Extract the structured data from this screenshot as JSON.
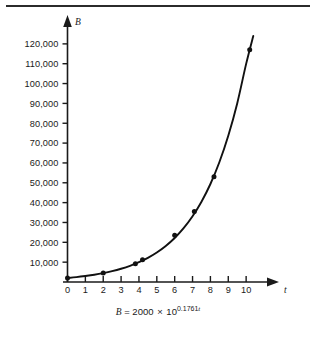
{
  "figure": {
    "background_color": "#ffffff",
    "ink_color": "#1a1a1a",
    "rule_color": "#2b2b2b"
  },
  "caption": {
    "lhs": "B",
    "equals": "=",
    "coefficient": "2000",
    "times": "×",
    "base": "10",
    "exponent_value": "0.1761",
    "exponent_var": "t"
  },
  "chart_data": {
    "type": "line",
    "title": "",
    "subtitle": "",
    "xlabel": "t",
    "ylabel": "B",
    "equation": "B = 2000 × 10^(0.1761t)",
    "grid": false,
    "legend": "none",
    "xlim": [
      0,
      11
    ],
    "ylim": [
      0,
      128000
    ],
    "x_ticks": [
      0,
      1,
      2,
      3,
      4,
      5,
      6,
      7,
      8,
      9,
      10
    ],
    "x_tick_labels": [
      "0",
      "1",
      "2",
      "3",
      "4",
      "5",
      "6",
      "7",
      "8",
      "9",
      "10"
    ],
    "y_ticks": [
      10000,
      20000,
      30000,
      40000,
      50000,
      60000,
      70000,
      80000,
      90000,
      100000,
      110000,
      120000
    ],
    "y_tick_labels": [
      "10,000",
      "20,000",
      "30,000",
      "40,000",
      "50,000",
      "60,000",
      "70,000",
      "80,000",
      "90,000",
      "100,000",
      "110,000",
      "120,000"
    ],
    "series": [
      {
        "name": "B = 2000 × 10^(0.1761t)",
        "x": [
          0,
          0.5,
          1,
          1.5,
          2,
          2.5,
          3,
          3.5,
          4,
          4.5,
          5,
          5.5,
          6,
          6.5,
          7,
          7.5,
          8,
          8.5,
          9,
          9.5,
          10,
          10.4
        ],
        "y": [
          2000,
          2440,
          3000,
          3660,
          4480,
          5470,
          6680,
          8160,
          9970,
          12180,
          14880,
          18170,
          22190,
          27110,
          33110,
          40440,
          49390,
          60330,
          73690,
          90000,
          109920,
          124000
        ]
      }
    ],
    "markers": [
      {
        "t": 0.0,
        "B": 2000
      },
      {
        "t": 2.0,
        "B": 4500
      },
      {
        "t": 3.8,
        "B": 9200
      },
      {
        "t": 4.2,
        "B": 11200
      },
      {
        "t": 6.0,
        "B": 23500
      },
      {
        "t": 7.1,
        "B": 35500
      },
      {
        "t": 8.2,
        "B": 53000
      },
      {
        "t": 10.2,
        "B": 117000
      }
    ]
  }
}
